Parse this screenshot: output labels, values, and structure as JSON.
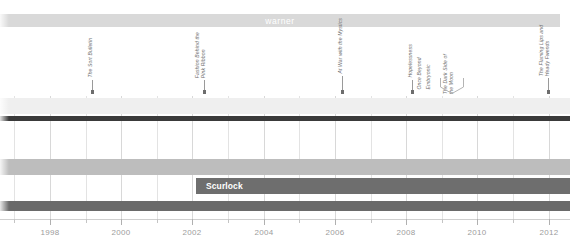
{
  "figure": {
    "type": "timeline",
    "title": "warner"
  },
  "lanes": [
    {
      "name": "warner",
      "label": "warner",
      "color": "#d9d9d9",
      "text_color": "#ffffff",
      "top": 14,
      "height": 13,
      "start_x": 0,
      "end_x": 560
    },
    {
      "name": "lane-light-upper",
      "label": "",
      "color": "#efefef",
      "top": 98,
      "height": 16,
      "start_x": 0,
      "end_x": 570
    },
    {
      "name": "lane-rule-dark",
      "label": "",
      "color": "#3a3a3a",
      "top": 116,
      "height": 5,
      "start_x": 0,
      "end_x": 570
    },
    {
      "name": "lane-mid-gray",
      "label": "",
      "color": "#bdbdbd",
      "top": 159,
      "height": 16,
      "start_x": 0,
      "end_x": 570
    },
    {
      "name": "lane-scurlock",
      "label": "Scurlock",
      "color": "#6e6e6e",
      "text_color": "#ffffff",
      "top": 178,
      "height": 16,
      "start_x": 196,
      "end_x": 570
    },
    {
      "name": "lane-bottom-dark",
      "label": "",
      "color": "#6a6a6a",
      "top": 201,
      "height": 10,
      "start_x": 0,
      "end_x": 570
    }
  ],
  "events": [
    {
      "name": "the-son-bulletin",
      "lines": [
        "The Sort Bulletin"
      ],
      "x": 92,
      "label_bottom": 92,
      "leader_height": 12,
      "caption_height": 52
    },
    {
      "name": "fashion-behind-pink-ribbon",
      "lines": [
        "Fashion Behind the",
        "Pink Ribbon"
      ],
      "x": 204,
      "label_bottom": 92,
      "leader_height": 12,
      "caption_height": 52
    },
    {
      "name": "at-war-with-the-mystic",
      "lines": [
        "At War with the Mystics"
      ],
      "x": 342,
      "label_bottom": 92,
      "leader_height": 16,
      "caption_height": 48
    },
    {
      "name": "hopelessness",
      "lines": [
        "Hopelessness"
      ],
      "x": 412,
      "label_bottom": 92,
      "leader_height": 12,
      "caption_height": 48
    },
    {
      "name": "once-beyond",
      "lines": [
        "Once Beyond"
      ],
      "x": 421,
      "label_bottom": 92,
      "leader_height": 0,
      "caption_height": 48
    },
    {
      "name": "embryonic",
      "lines": [
        "Embryonic"
      ],
      "x": 430,
      "label_bottom": 92,
      "leader_height": 0,
      "caption_height": 48
    },
    {
      "name": "the-dark-side-of-the-moon",
      "lines": [
        "The Dark Side of",
        "the Moon"
      ],
      "x": 452,
      "label_bottom": 96,
      "leader_height": 0,
      "caption_height": 52
    },
    {
      "name": "the-flaming-lips-and-heady-fwends",
      "lines": [
        "The Flaming Lips and",
        "Heady Fwends"
      ],
      "x": 548,
      "label_bottom": 92,
      "leader_height": 14,
      "caption_height": 56
    }
  ],
  "bracket": {
    "name": "dark-side-range-bracket",
    "left": 440,
    "right": 464,
    "top": 78,
    "bottom": 94,
    "color": "#b4b4b4"
  },
  "axis": {
    "name": "year-axis",
    "top": 219,
    "x_start": 0,
    "x_end": 570,
    "year_min": 1996.6,
    "year_max": 2012.6,
    "labels": [
      "1998",
      "2000",
      "2002",
      "2004",
      "2006",
      "2008",
      "2010",
      "2012"
    ],
    "label_values": [
      1998,
      2000,
      2002,
      2004,
      2006,
      2008,
      2010,
      2012
    ],
    "minor_step": 1,
    "tick_color": "#c4c4c4",
    "text_color": "#9c9c9c"
  },
  "chart_data": {
    "type": "timeline",
    "title": "warner",
    "xlabel": "",
    "ylabel": "",
    "xlim": [
      1996.6,
      2012.6
    ],
    "xticks": [
      1998,
      2000,
      2002,
      2004,
      2006,
      2008,
      2010,
      2012
    ],
    "grid": true,
    "legend": "none",
    "series": [
      {
        "name": "label-era-bands",
        "items": [
          {
            "label": "warner",
            "start": 1996.6,
            "end": 2012.3,
            "row": 0,
            "color": "#d9d9d9"
          },
          {
            "label": "",
            "start": 1996.6,
            "end": 2012.6,
            "row": 1,
            "color": "#efefef"
          },
          {
            "label": "",
            "start": 1996.6,
            "end": 2012.6,
            "row": 2,
            "color": "#3a3a3a"
          },
          {
            "label": "",
            "start": 1996.6,
            "end": 2012.6,
            "row": 3,
            "color": "#bdbdbd"
          },
          {
            "label": "Scurlock",
            "start": 2002.1,
            "end": 2012.6,
            "row": 4,
            "color": "#6e6e6e"
          },
          {
            "label": "",
            "start": 1996.6,
            "end": 2012.6,
            "row": 5,
            "color": "#6a6a6a"
          }
        ]
      },
      {
        "name": "release-events",
        "items": [
          {
            "label": "The Sort Bulletin",
            "year": 1999.2
          },
          {
            "label": "Fashion Behind the Pink Ribbon",
            "year": 2002.3
          },
          {
            "label": "At War with the Mystics",
            "year": 2006.2
          },
          {
            "label": "Hopelessness",
            "year": 2008.1
          },
          {
            "label": "Once Beyond",
            "year": 2008.4
          },
          {
            "label": "Embryonic",
            "year": 2008.6
          },
          {
            "label": "The Dark Side of the Moon",
            "year": 2009.3
          },
          {
            "label": "The Flaming Lips and Heady Fwends",
            "year": 2012.0
          }
        ]
      }
    ]
  }
}
